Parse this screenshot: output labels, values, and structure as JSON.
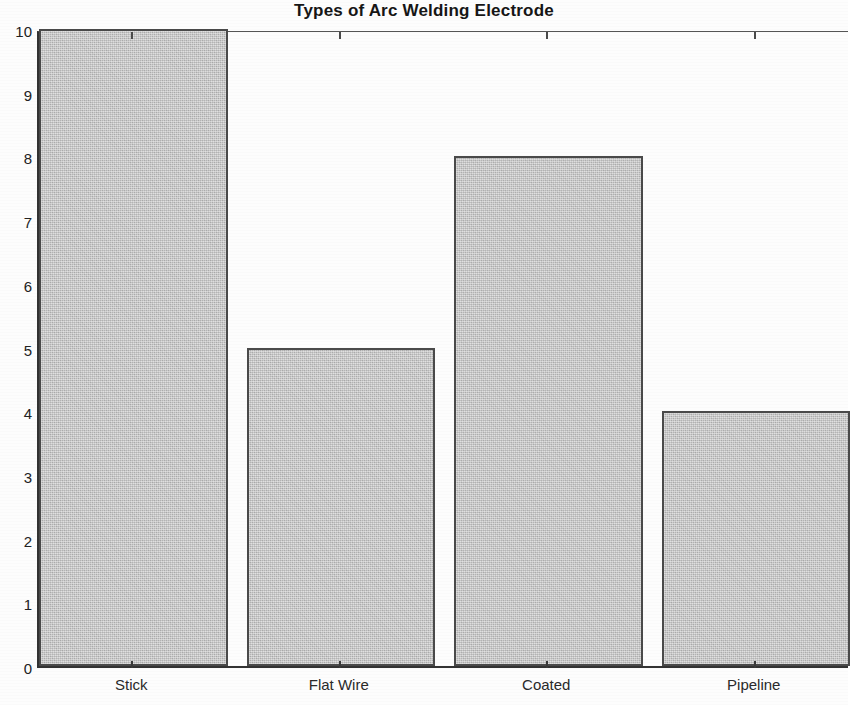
{
  "chart_data": {
    "type": "bar",
    "title": "Types of Arc Welding Electrode",
    "xlabel": "",
    "ylabel": "",
    "categories": [
      "Stick",
      "Flat Wire",
      "Coated",
      "Pipeline"
    ],
    "values": [
      10,
      5,
      8,
      4
    ],
    "ylim": [
      0,
      10
    ],
    "y_ticks": [
      0,
      1,
      2,
      3,
      4,
      5,
      6,
      7,
      8,
      9,
      10
    ],
    "y_tick_labels": [
      "0",
      "1",
      "2",
      "3",
      "4",
      "5",
      "6",
      "7",
      "8",
      "9",
      "10"
    ],
    "grid": false,
    "legend": null,
    "bar_fill_color": "#c3c3c3",
    "bar_edge_color": "#4a4a4a",
    "axis_color": "#333333",
    "background_color": "#ffffff"
  }
}
